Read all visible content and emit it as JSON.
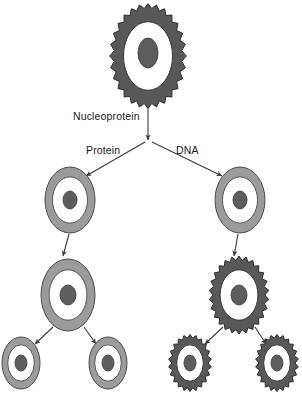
{
  "diagram": {
    "type": "flow-diagram",
    "background_color": "#ffffff",
    "width": 302,
    "height": 402,
    "palette": {
      "spiky_ring_fill": "#585858",
      "spiky_ring_stroke": "#2e2e2e",
      "smooth_ring_fill": "#9b9b9b",
      "smooth_ring_stroke": "#4a4a4a",
      "cytoplasm_fill": "#ffffff",
      "nucleus_fill": "#5d5d5d",
      "nucleus_stroke": "#3a3a3a",
      "arrow_color": "#3a3a3a",
      "label_color": "#1b1b1b"
    },
    "labels": [
      {
        "id": "nucleoprotein",
        "text": "Nucleoprotein",
        "x": 73,
        "y": 120,
        "anchor": "start"
      },
      {
        "id": "protein",
        "text": "Protein",
        "x": 86,
        "y": 154,
        "anchor": "start"
      },
      {
        "id": "dna",
        "text": "DNA",
        "x": 176,
        "y": 154,
        "anchor": "start"
      }
    ],
    "nodes": [
      {
        "id": "nucleoprotein-cell",
        "name": "nucleoprotein-cell",
        "level": 0,
        "style": "spiky",
        "cx": 148,
        "cy": 56,
        "rx": 35,
        "ry": 49,
        "ring_thickness": 0.3,
        "teeth": 28,
        "tooth_depth": 3.4,
        "nucleus_rx": 10,
        "nucleus_ry": 15,
        "nucleus_dy": -3
      },
      {
        "id": "protein-cell-l2",
        "name": "protein-cell-level2",
        "level": 1,
        "style": "smooth",
        "cx": 70,
        "cy": 200,
        "rx": 25,
        "ry": 33,
        "ring_thickness": 0.3,
        "nucleus_rx": 7,
        "nucleus_ry": 9,
        "nucleus_dy": 0
      },
      {
        "id": "dna-cell-l2",
        "name": "dna-cell-level2",
        "level": 1,
        "style": "smooth",
        "cx": 240,
        "cy": 200,
        "rx": 25,
        "ry": 33,
        "ring_thickness": 0.3,
        "nucleus_rx": 7,
        "nucleus_ry": 9,
        "nucleus_dy": 0
      },
      {
        "id": "protein-cell-l3",
        "name": "protein-cell-level3",
        "level": 2,
        "style": "smooth",
        "cx": 68,
        "cy": 295,
        "rx": 27,
        "ry": 36,
        "ring_thickness": 0.3,
        "nucleus_rx": 8,
        "nucleus_ry": 10,
        "nucleus_dy": 0
      },
      {
        "id": "dna-cell-l3",
        "name": "dna-cell-level3",
        "level": 2,
        "style": "spiky",
        "cx": 239,
        "cy": 295,
        "rx": 27,
        "ry": 36,
        "ring_thickness": 0.3,
        "teeth": 26,
        "tooth_depth": 3.0,
        "nucleus_rx": 8,
        "nucleus_ry": 10,
        "nucleus_dy": 0
      },
      {
        "id": "protein-cell-l4-left",
        "name": "protein-cell-level4-left",
        "level": 3,
        "style": "smooth",
        "cx": 21,
        "cy": 363,
        "rx": 19,
        "ry": 26,
        "ring_thickness": 0.3,
        "nucleus_rx": 6,
        "nucleus_ry": 8,
        "nucleus_dy": 0
      },
      {
        "id": "protein-cell-l4-right",
        "name": "protein-cell-level4-right",
        "level": 3,
        "style": "smooth",
        "cx": 108,
        "cy": 363,
        "rx": 19,
        "ry": 26,
        "ring_thickness": 0.3,
        "nucleus_rx": 6,
        "nucleus_ry": 8,
        "nucleus_dy": 0
      },
      {
        "id": "dna-cell-l4-left",
        "name": "dna-cell-level4-left",
        "level": 3,
        "style": "spiky",
        "cx": 190,
        "cy": 363,
        "rx": 19,
        "ry": 26,
        "ring_thickness": 0.3,
        "teeth": 22,
        "tooth_depth": 2.6,
        "nucleus_rx": 6,
        "nucleus_ry": 8,
        "nucleus_dy": 0
      },
      {
        "id": "dna-cell-l4-right",
        "name": "dna-cell-level4-right",
        "level": 3,
        "style": "spiky",
        "cx": 277,
        "cy": 363,
        "rx": 19,
        "ry": 26,
        "ring_thickness": 0.3,
        "teeth": 22,
        "tooth_depth": 2.6,
        "nucleus_rx": 6,
        "nucleus_ry": 8,
        "nucleus_dy": 0
      }
    ],
    "edges": [
      {
        "id": "e-stem",
        "name": "arrow-nucleoprotein-stem",
        "from": "nucleoprotein-cell",
        "to": "branch-point",
        "x1": 148,
        "y1": 53,
        "x2": 148,
        "y2": 140,
        "arrowhead": true
      },
      {
        "id": "e-protein",
        "name": "arrow-to-protein",
        "from": "branch-point",
        "to": "protein-cell-l2",
        "x1": 145,
        "y1": 142,
        "x2": 86,
        "y2": 176,
        "arrowhead": true
      },
      {
        "id": "e-dna",
        "name": "arrow-to-dna",
        "from": "branch-point",
        "to": "dna-cell-l2",
        "x1": 152,
        "y1": 142,
        "x2": 222,
        "y2": 176,
        "arrowhead": true
      },
      {
        "id": "e-protein-l2-l3",
        "name": "arrow-protein-level2-to-level3",
        "from": "protein-cell-l2",
        "to": "protein-cell-l3",
        "x1": 69,
        "y1": 234,
        "x2": 63,
        "y2": 256,
        "arrowhead": true
      },
      {
        "id": "e-dna-l2-l3",
        "name": "arrow-dna-level2-to-level3",
        "from": "dna-cell-l2",
        "to": "dna-cell-l3",
        "x1": 238,
        "y1": 234,
        "x2": 234,
        "y2": 256,
        "arrowhead": true
      },
      {
        "id": "e-protein-l3-l4a",
        "name": "arrow-protein-level3-to-level4-left",
        "from": "protein-cell-l3",
        "to": "protein-cell-l4-left",
        "x1": 53,
        "y1": 327,
        "x2": 35,
        "y2": 344,
        "arrowhead": true
      },
      {
        "id": "e-protein-l3-l4b",
        "name": "arrow-protein-level3-to-level4-right",
        "from": "protein-cell-l3",
        "to": "protein-cell-l4-right",
        "x1": 84,
        "y1": 327,
        "x2": 96,
        "y2": 344,
        "arrowhead": true
      },
      {
        "id": "e-dna-l3-l4a",
        "name": "arrow-dna-level3-to-level4-left",
        "from": "dna-cell-l3",
        "to": "dna-cell-l4-left",
        "x1": 223,
        "y1": 327,
        "x2": 205,
        "y2": 344,
        "arrowhead": true
      },
      {
        "id": "e-dna-l3-l4b",
        "name": "arrow-dna-level3-to-level4-right",
        "from": "dna-cell-l3",
        "to": "dna-cell-l4-right",
        "x1": 255,
        "y1": 327,
        "x2": 266,
        "y2": 344,
        "arrowhead": true
      }
    ]
  }
}
